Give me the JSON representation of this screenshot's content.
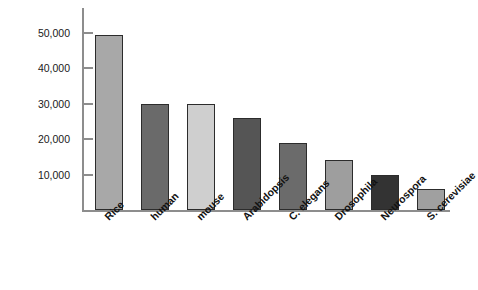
{
  "chart_data": {
    "type": "bar",
    "title": "",
    "subtitle": "",
    "xlabel": "",
    "ylabel": "Gene number",
    "categories": [
      "Rice",
      "human",
      "mouse",
      "Arabidopsis",
      "C. elegans",
      "Drosophila",
      "Neurospora",
      "S. cerevisiae"
    ],
    "values": [
      49500,
      30000,
      30000,
      26000,
      19000,
      14000,
      10000,
      6000
    ],
    "bar_colors": [
      "#a8a8a8",
      "#6a6a6a",
      "#cfcfcf",
      "#555555",
      "#6b6b6b",
      "#9e9e9e",
      "#333333",
      "#a0a0a0"
    ],
    "ylim": [
      0,
      57000
    ],
    "yticks": [
      10000,
      20000,
      30000,
      40000,
      50000
    ],
    "ytick_labels": [
      "10,000",
      "20,000",
      "30,000",
      "40,000",
      "50,000"
    ],
    "grid": false,
    "legend": null,
    "legend_position": "none",
    "axis_color": "#8d8d8d",
    "bar_border_color": "#2c2c2c",
    "label_rotation_deg": -45
  }
}
